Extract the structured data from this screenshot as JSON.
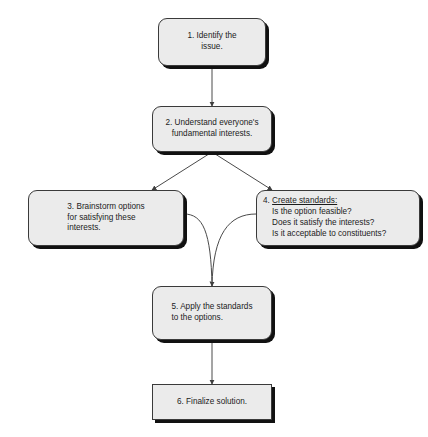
{
  "diagram": {
    "background_color": "#ffffff",
    "node_fill_color": "#ebebeb",
    "node_border_color": "#3a3a3a",
    "shadow_color": "#111111",
    "connector_color": "#4a4a4a"
  },
  "nodes": {
    "step1": {
      "label": "1. Identify the\nissue.",
      "shape": "rounded-rectangle"
    },
    "step2": {
      "label": "2. Understand everyone's\nfundamental interests.",
      "shape": "rounded-rectangle"
    },
    "step3": {
      "label": "3. Brainstorm options\n    for satisfying these\n    interests.",
      "shape": "rounded-rectangle"
    },
    "step4": {
      "number": "4. ",
      "heading": "Create standards:",
      "questions": "Is the option feasible?\nDoes it satisfy the interests?\nIs it acceptable to constituents?",
      "shape": "rounded-rectangle"
    },
    "step5": {
      "label": "5. Apply the standards\n    to the options.",
      "shape": "rounded-rectangle"
    },
    "step6": {
      "label": "6. Finalize solution.",
      "shape": "rectangle"
    }
  },
  "connectors": [
    {
      "name": "step1-to-step2",
      "from": "step1",
      "to": "step2",
      "style": "straight-vertical-arrow"
    },
    {
      "name": "step2-to-step3",
      "from": "step2",
      "to": "step3",
      "style": "diagonal-arrow"
    },
    {
      "name": "step2-to-step4",
      "from": "step2",
      "to": "step4",
      "style": "diagonal-arrow"
    },
    {
      "name": "step3-to-step5",
      "from": "step3",
      "to": "step5",
      "style": "curved-merge"
    },
    {
      "name": "step4-to-step5",
      "from": "step4",
      "to": "step5",
      "style": "curved-merge"
    },
    {
      "name": "step5-to-step6",
      "from": "step5",
      "to": "step6",
      "style": "straight-vertical-arrow"
    }
  ]
}
